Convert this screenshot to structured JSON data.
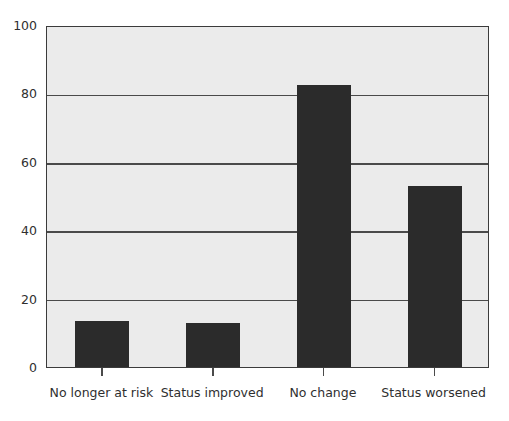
{
  "chart_data": {
    "type": "bar",
    "title": "",
    "subtitle": "",
    "xlabel": "",
    "ylabel": "",
    "categories": [
      "No longer at risk",
      "Status improved",
      "No change",
      "Status worsened"
    ],
    "values": [
      13.5,
      12.8,
      82.5,
      53
    ],
    "series": [
      {
        "name": "",
        "values": [
          13.5,
          12.8,
          82.5,
          53
        ]
      }
    ],
    "ylim": [
      0,
      100
    ],
    "yticks": [
      0,
      20,
      40,
      60,
      80,
      100
    ],
    "ytick_labels": [
      "0",
      "20",
      "40",
      "60",
      "80",
      "100"
    ],
    "grid": "horizontal",
    "legend": "none",
    "annotations": [],
    "colors": {
      "bar_fill": "#2b2b2b",
      "plot_background": "#ebebeb",
      "gridline": "#4a4a4a",
      "axis": "#3b3b3b",
      "text": "#2f2f2f",
      "figure_background": "#ffffff"
    }
  }
}
